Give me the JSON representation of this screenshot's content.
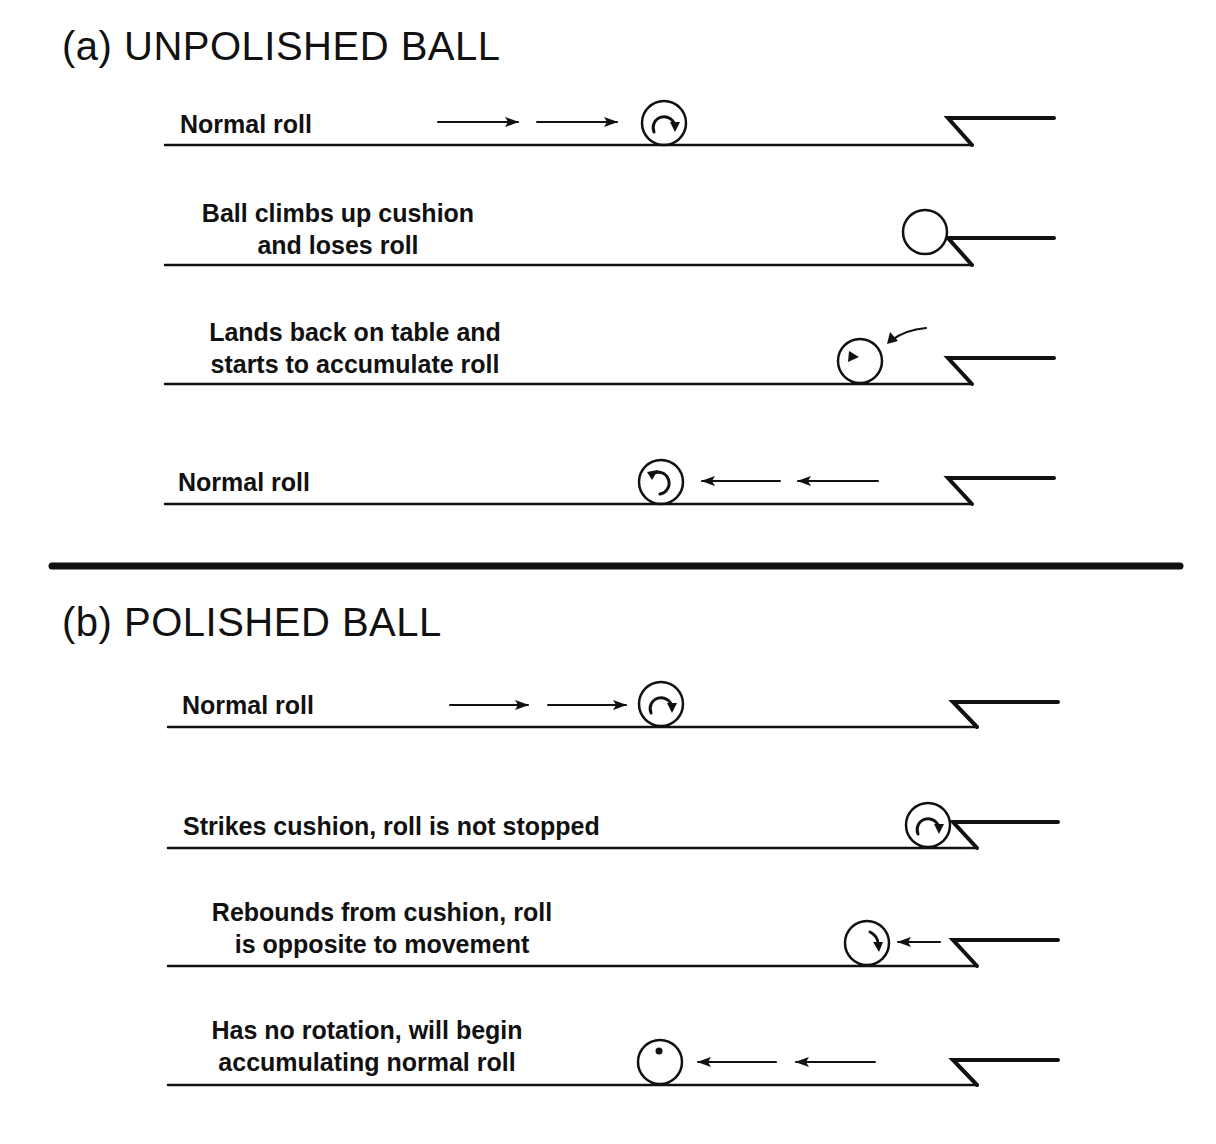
{
  "sections": [
    {
      "title": "(a) UNPOLISHED BALL",
      "rows": [
        {
          "label_lines": [
            "Normal roll"
          ],
          "ball": "roll-forward",
          "arrows": "right-2"
        },
        {
          "label_lines": [
            "Ball climbs up cushion",
            "and loses roll"
          ],
          "ball": "plain-on-cushion",
          "arrows": "none"
        },
        {
          "label_lines": [
            "Lands back on table and",
            "starts to accumulate roll"
          ],
          "ball": "small-arrow-inside",
          "arrows": "curved-incoming"
        },
        {
          "label_lines": [
            "Normal roll"
          ],
          "ball": "roll-backward",
          "arrows": "left-2"
        }
      ]
    },
    {
      "title": "(b) POLISHED BALL",
      "rows": [
        {
          "label_lines": [
            "Normal roll"
          ],
          "ball": "roll-forward",
          "arrows": "right-2"
        },
        {
          "label_lines": [
            "Strikes cushion, roll is not stopped"
          ],
          "ball": "roll-forward-at-cushion",
          "arrows": "none"
        },
        {
          "label_lines": [
            "Rebounds from cushion, roll",
            "is opposite to movement"
          ],
          "ball": "reverse-spin",
          "arrows": "left-1"
        },
        {
          "label_lines": [
            "Has no rotation, will begin",
            "accumulating normal roll"
          ],
          "ball": "dot-no-rotation",
          "arrows": "left-2"
        }
      ]
    }
  ],
  "colors": {
    "ink": "#111111",
    "background": "#ffffff"
  }
}
